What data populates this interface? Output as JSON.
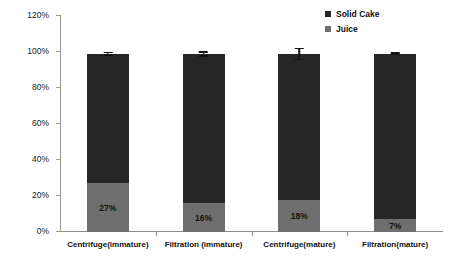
{
  "chart_data": {
    "type": "bar",
    "subtype": "stacked-bar",
    "title": "",
    "xlabel": "",
    "ylabel": "Proportion of PM as Dry Matter",
    "ylim": [
      0,
      120
    ],
    "ytick_labels": [
      "0%",
      "20%",
      "40%",
      "60%",
      "80%",
      "100%",
      "120%"
    ],
    "ytick_values": [
      0,
      20,
      40,
      60,
      80,
      100,
      120
    ],
    "grid": false,
    "legend_position": "top-right",
    "categories": [
      "Centrifuge(immature)",
      "Filtration (immature)",
      "Centrifuge(mature)",
      "Filtration(mature)"
    ],
    "series": [
      {
        "name": "Solid Cake",
        "color": "#262626",
        "values": [
          72,
          83,
          81,
          92
        ]
      },
      {
        "name": "Juice",
        "color": "#6e6e6e",
        "values": [
          27,
          16,
          18,
          7
        ]
      }
    ],
    "totals": [
      99,
      99,
      99,
      99
    ],
    "data_labels": [
      "27%",
      "16%",
      "18%",
      "7%"
    ],
    "error_bars": [
      1.2,
      1.5,
      3.5,
      0.8
    ]
  },
  "legend": {
    "items": [
      {
        "label": "Solid Cake",
        "color": "#262626"
      },
      {
        "label": "Juice",
        "color": "#6e6e6e"
      }
    ]
  }
}
